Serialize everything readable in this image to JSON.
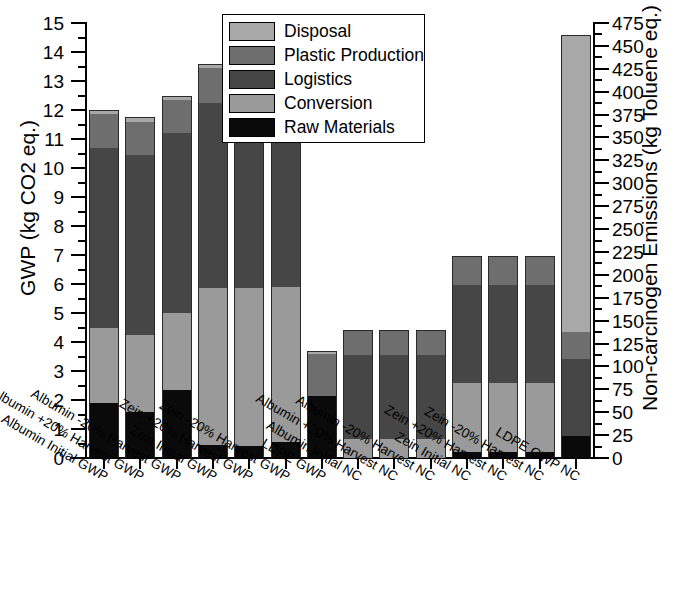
{
  "chart_data": {
    "type": "bar",
    "stacked": true,
    "title": "",
    "xlabel": "",
    "ylabel": "GWP (kg CO2 eq.)",
    "y2label": "Non-carcinogen Emissions (kg Toluene eq.)",
    "ylim": [
      0,
      15
    ],
    "y2lim": [
      0,
      475
    ],
    "yticks": [
      0,
      1,
      2,
      3,
      4,
      5,
      6,
      7,
      8,
      9,
      10,
      11,
      12,
      13,
      14,
      15
    ],
    "y2ticks": [
      0,
      25,
      50,
      75,
      100,
      125,
      150,
      175,
      200,
      225,
      250,
      275,
      300,
      325,
      350,
      375,
      400,
      425,
      450,
      475
    ],
    "grid": false,
    "legend_position": "top-center",
    "series_order_bottom_to_top": [
      "Raw Materials",
      "Conversion",
      "Logistics",
      "Plastic Production",
      "Disposal"
    ],
    "legend": [
      {
        "label": "Disposal",
        "color": "#a8a8a8"
      },
      {
        "label": "Plastic Production",
        "color": "#6e6e6e"
      },
      {
        "label": "Logistics",
        "color": "#464646"
      },
      {
        "label": "Conversion",
        "color": "#9a9a9a"
      },
      {
        "label": "Raw Materials",
        "color": "#0a0a0a"
      }
    ],
    "categories": [
      "Albumin Initial GWP",
      "Albumin +20% Harvest GWP",
      "Albumin -20% Harvest GWP",
      "Zein Initial GWP",
      "Zein +20% Harvest GWP",
      "Zein -20% Harvest GWP",
      "LDPE GWP",
      "Albumin Initial NC",
      "Albumin +20% Harvest NC",
      "Albumin -20% Harvest NC",
      "Zein Initial NC",
      "Zein +20% Harvest NC",
      "Zein -20% Harvest NC",
      "LDPE GWP NC"
    ],
    "axis_for_category": [
      "left",
      "left",
      "left",
      "left",
      "left",
      "left",
      "left",
      "right",
      "right",
      "right",
      "right",
      "right",
      "right",
      "right"
    ],
    "series": [
      {
        "name": "Raw Materials",
        "values": [
          1.9,
          1.6,
          2.35,
          0.45,
          0.4,
          0.55,
          2.15,
          0.0,
          0.0,
          0.0,
          0.2,
          0.2,
          0.2,
          0.75
        ]
      },
      {
        "name": "Conversion",
        "values": [
          2.6,
          2.65,
          2.65,
          5.4,
          5.45,
          5.35,
          0.0,
          0.65,
          0.65,
          0.65,
          2.4,
          2.4,
          2.4,
          0.0
        ]
      },
      {
        "name": "Logistics",
        "values": [
          6.2,
          6.2,
          6.2,
          6.4,
          6.35,
          6.45,
          0.0,
          2.9,
          2.9,
          2.9,
          3.35,
          3.35,
          3.35,
          2.65
        ]
      },
      {
        "name": "Plastic Production",
        "values": [
          1.15,
          1.15,
          1.15,
          1.2,
          1.2,
          1.2,
          1.45,
          0.85,
          0.85,
          0.85,
          1.0,
          1.0,
          1.0,
          0.95
        ]
      },
      {
        "name": "Disposal",
        "values": [
          0.15,
          0.15,
          0.15,
          0.15,
          0.15,
          0.15,
          0.1,
          0.0,
          0.0,
          0.0,
          0.0,
          0.0,
          0.0,
          10.25
        ]
      }
    ],
    "totals_left_axis": [
      12.0,
      11.75,
      12.5,
      13.6,
      13.55,
      13.7,
      3.7,
      4.4,
      4.4,
      4.4,
      6.95,
      6.95,
      6.95,
      14.6
    ],
    "totals_right_axis_kg_toluene": [
      null,
      null,
      null,
      null,
      null,
      null,
      null,
      139,
      139,
      139,
      220,
      220,
      220,
      462
    ]
  }
}
